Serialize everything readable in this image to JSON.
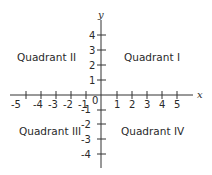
{
  "diagram": {
    "type": "cartesian-coordinate-plane",
    "axes": {
      "x": {
        "label": "x",
        "ticks": [
          "-5",
          "-4",
          "-3",
          "-2",
          "-1",
          "1",
          "2",
          "3",
          "4",
          "5"
        ]
      },
      "y": {
        "label": "y",
        "ticks": [
          "4",
          "3",
          "2",
          "1",
          "-1",
          "-2",
          "-3",
          "-4"
        ]
      },
      "origin_label": "0"
    },
    "quadrants": {
      "q1": "Quadrant I",
      "q2": "Quadrant II",
      "q3": "Quadrant III",
      "q4": "Quadrant IV"
    },
    "colors": {
      "line": "#333333",
      "text": "#2a2a2a",
      "background": "#ffffff"
    }
  }
}
